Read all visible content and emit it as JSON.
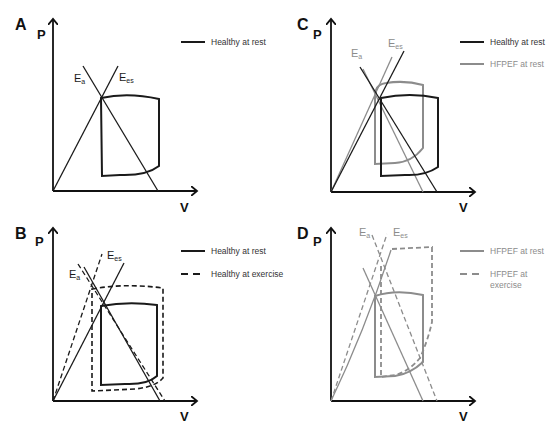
{
  "figure": {
    "colors": {
      "healthy": "#1a1a1a",
      "hfpef": "#8c8c8c",
      "axis": "#111111"
    },
    "panels": [
      {
        "id": "A",
        "letter": "A",
        "y_axis": "P",
        "x_axis": "V",
        "ea_label": "E",
        "ea_sub": "a",
        "ees_label": "E",
        "ees_sub": "es",
        "legend": [
          {
            "label": "Healthy at rest",
            "style": "solid",
            "color": "#1a1a1a"
          }
        ]
      },
      {
        "id": "B",
        "letter": "B",
        "y_axis": "P",
        "x_axis": "V",
        "ea_label": "E",
        "ea_sub": "a",
        "ees_label": "E",
        "ees_sub": "es",
        "legend": [
          {
            "label": "Healthy at rest",
            "style": "solid",
            "color": "#1a1a1a"
          },
          {
            "label": "Healthy at exercise",
            "style": "dashed",
            "color": "#1a1a1a"
          }
        ]
      },
      {
        "id": "C",
        "letter": "C",
        "y_axis": "P",
        "x_axis": "V",
        "ea_label": "E",
        "ea_sub": "a",
        "ees_label": "E",
        "ees_sub": "es",
        "legend": [
          {
            "label": "Healthy at rest",
            "style": "solid",
            "color": "#1a1a1a"
          },
          {
            "label": "HFPEF at rest",
            "style": "solid",
            "color": "#8c8c8c"
          }
        ]
      },
      {
        "id": "D",
        "letter": "D",
        "y_axis": "P",
        "x_axis": "V",
        "ea_label": "E",
        "ea_sub": "a",
        "ees_label": "E",
        "ees_sub": "es",
        "legend": [
          {
            "label": "HFPEF at rest",
            "style": "solid",
            "color": "#8c8c8c"
          },
          {
            "label": "HFPEF at",
            "label_line2": "exercise",
            "style": "dashed",
            "color": "#8c8c8c"
          }
        ]
      }
    ]
  }
}
